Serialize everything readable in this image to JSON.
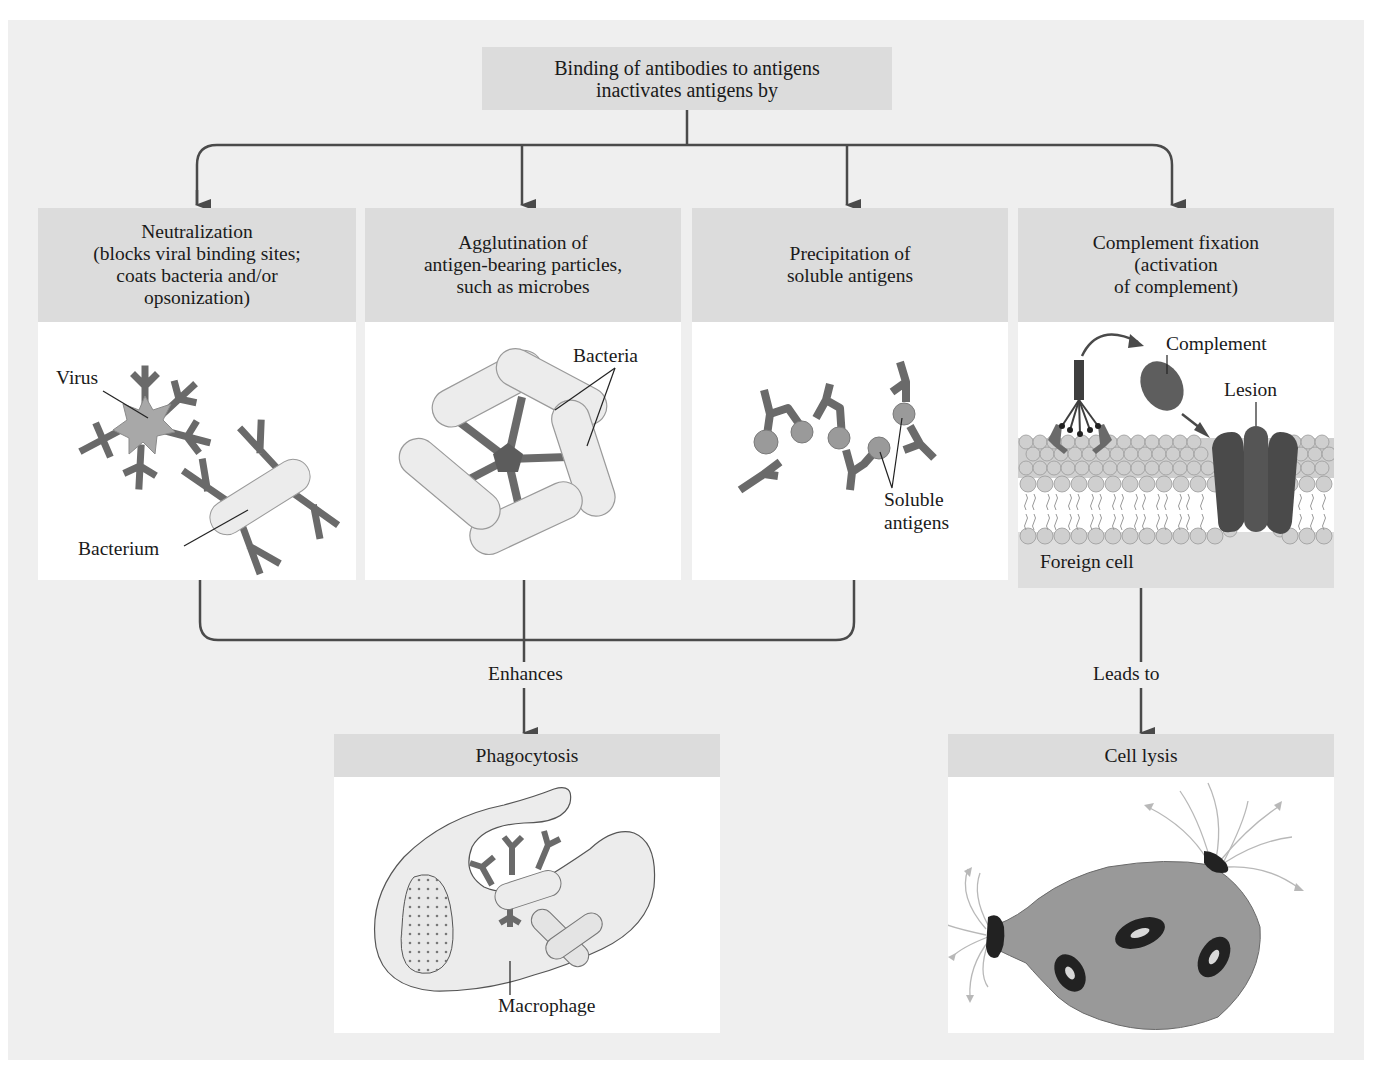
{
  "title": {
    "text": "Binding of antibodies to antigens\ninactivates antigens by"
  },
  "mechanisms": [
    {
      "id": "neutralization",
      "header": "Neutralization\n(blocks viral binding sites;\ncoats bacteria and/or\nopsonization)",
      "labels": {
        "virus": "Virus",
        "bacterium": "Bacterium"
      }
    },
    {
      "id": "agglutination",
      "header": "Agglutination of\nantigen-bearing particles,\nsuch as microbes",
      "labels": {
        "bacteria": "Bacteria"
      }
    },
    {
      "id": "precipitation",
      "header": "Precipitation of\nsoluble antigens",
      "labels": {
        "soluble_antigens": "Soluble\nantigens"
      }
    },
    {
      "id": "complement",
      "header": "Complement fixation\n(activation\nof complement)",
      "labels": {
        "complement": "Complement",
        "lesion": "Lesion",
        "foreign_cell": "Foreign cell"
      }
    }
  ],
  "connectors": {
    "enhances": "Enhances",
    "leads_to": "Leads to"
  },
  "outcomes": [
    {
      "id": "phagocytosis",
      "header": "Phagocytosis",
      "labels": {
        "macrophage": "Macrophage"
      }
    },
    {
      "id": "cell_lysis",
      "header": "Cell lysis"
    }
  ],
  "colors": {
    "background": "#efefef",
    "header_fill": "#dcdcdc",
    "panel_fill": "#ffffff",
    "antibody": "#6a6a6a",
    "antigen": "#9a9a9a",
    "bacterium": "#ececec",
    "arrow": "#4a4a4a"
  }
}
